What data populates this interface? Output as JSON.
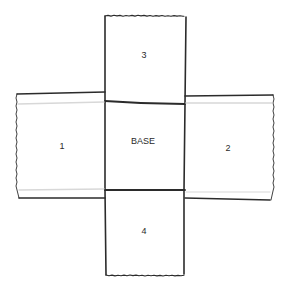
{
  "diagram": {
    "colors": {
      "line": "#2b2b2b",
      "fold_hint": "#d8d8d8",
      "background": "#ffffff",
      "text": "#2a2a2a"
    },
    "panels": [
      {
        "id": "base",
        "label": "BASE"
      },
      {
        "id": "flap-1",
        "label": "1"
      },
      {
        "id": "flap-2",
        "label": "2"
      },
      {
        "id": "flap-3",
        "label": "3"
      },
      {
        "id": "flap-4",
        "label": "4"
      }
    ]
  }
}
